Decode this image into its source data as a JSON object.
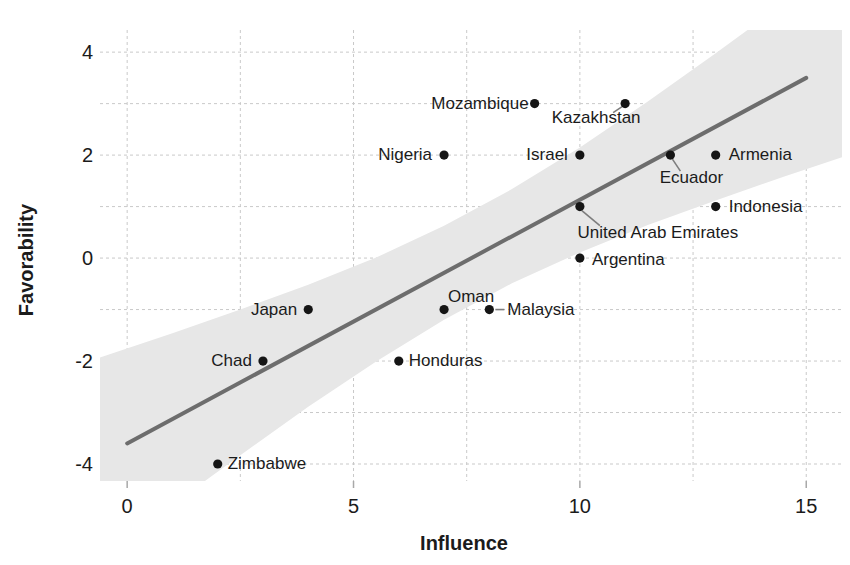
{
  "chart_data": {
    "type": "scatter",
    "title": "",
    "xlabel": "Influence",
    "ylabel": "Favorability",
    "xlim": [
      -0.6,
      15.79
    ],
    "ylim": [
      -4.33,
      4.43
    ],
    "x_ticks": [
      0,
      5,
      10,
      15
    ],
    "y_ticks": [
      4,
      2,
      0,
      -2,
      -4
    ],
    "x_gridlines": [
      0,
      2.5,
      5,
      7.5,
      10,
      12.5,
      15
    ],
    "y_gridlines": [
      -4,
      -3,
      -2,
      -1,
      0,
      1,
      2,
      3,
      4
    ],
    "grid_style": "dashed",
    "legend": "none",
    "points": [
      {
        "label": "Mozambique",
        "x": 9,
        "y": 3,
        "anchor": "end",
        "dx": -6,
        "dy": 5
      },
      {
        "label": "Kazakhstan",
        "x": 11,
        "y": 3,
        "anchor": "middle",
        "dx": -29,
        "dy": 19,
        "leader": [
          -3,
          3,
          -12,
          9
        ]
      },
      {
        "label": "Nigeria",
        "x": 7,
        "y": 2,
        "anchor": "end",
        "dx": -12,
        "dy": 5
      },
      {
        "label": "Israel",
        "x": 10,
        "y": 2,
        "anchor": "end",
        "dx": -12,
        "dy": 5
      },
      {
        "label": "Ecuador",
        "x": 12,
        "y": 2,
        "anchor": "middle",
        "dx": 21,
        "dy": 28,
        "leader": [
          2,
          4,
          10,
          16
        ]
      },
      {
        "label": "Armenia",
        "x": 13,
        "y": 2,
        "anchor": "start",
        "dx": 13,
        "dy": 5
      },
      {
        "label": "United Arab Emirates",
        "x": 10,
        "y": 1,
        "anchor": "middle",
        "dx": 78,
        "dy": 31,
        "leader": [
          2,
          4,
          20,
          19
        ]
      },
      {
        "label": "Indonesia",
        "x": 13,
        "y": 1,
        "anchor": "start",
        "dx": 13,
        "dy": 5
      },
      {
        "label": "Argentina",
        "x": 10,
        "y": 0,
        "anchor": "start",
        "dx": 12,
        "dy": 7
      },
      {
        "label": "Japan",
        "x": 4,
        "y": -1,
        "anchor": "end",
        "dx": -11,
        "dy": 5
      },
      {
        "label": "Oman",
        "x": 7,
        "y": -1,
        "anchor": "middle",
        "dx": 27,
        "dy": -8
      },
      {
        "label": "Malaysia",
        "x": 8,
        "y": -1,
        "anchor": "start",
        "dx": 18,
        "dy": 5,
        "leader": [
          6,
          0,
          15,
          0
        ]
      },
      {
        "label": "Chad",
        "x": 3,
        "y": -2,
        "anchor": "end",
        "dx": -11,
        "dy": 5
      },
      {
        "label": "Honduras",
        "x": 6,
        "y": -2,
        "anchor": "start",
        "dx": 10,
        "dy": 5
      },
      {
        "label": "Zimbabwe",
        "x": 2,
        "y": -4,
        "anchor": "start",
        "dx": 10,
        "dy": 5
      }
    ],
    "regression_line": {
      "x1": 0,
      "y1": -3.6,
      "x2": 15,
      "y2": 3.5
    },
    "confidence_band": {
      "x": [
        -0.6,
        1,
        2.5,
        4,
        5.5,
        7,
        8.5,
        10,
        11.5,
        13,
        14.5,
        15.79
      ],
      "upper": [
        -1.93,
        -1.46,
        -1.0,
        -0.52,
        0.01,
        0.63,
        1.34,
        2.15,
        3.04,
        3.98,
        4.94,
        5.79
      ],
      "lower": [
        -5.84,
        -4.79,
        -3.83,
        -2.89,
        -2.01,
        -1.2,
        -0.49,
        0.11,
        0.64,
        1.12,
        1.58,
        1.96
      ]
    },
    "colors": {
      "point": "#151515",
      "point_label": "#1b1b1b",
      "regression_line": "#6d6d6d",
      "confidence_band": "#e7e7e7",
      "gridline": "#c9c9c9",
      "tick_mark": "#a8a8a8",
      "axis_text": "#1b1b1b",
      "leader_line": "#7d7d7d",
      "background": "#ffffff"
    }
  }
}
